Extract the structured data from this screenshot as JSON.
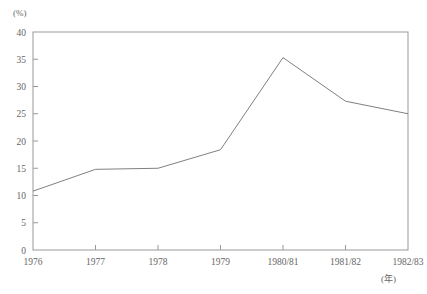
{
  "chart_data": {
    "type": "line",
    "title": "",
    "subtitle": "",
    "xlabel": "(年)",
    "ylabel": "(%)",
    "categories": [
      "1976",
      "1977",
      "1978",
      "1979",
      "1980/81",
      "1981/82",
      "1982/83"
    ],
    "values": [
      10.8,
      14.8,
      15.0,
      18.4,
      35.3,
      27.3,
      25.0
    ],
    "series": [
      {
        "name": "",
        "values": [
          10.8,
          14.8,
          15.0,
          18.4,
          35.3,
          27.3,
          25.0
        ]
      }
    ],
    "ylim": [
      0,
      40
    ],
    "yticks": [
      0,
      5,
      10,
      15,
      20,
      25,
      30,
      35,
      40
    ],
    "ytick_labels": [
      "0",
      "5",
      "10",
      "15",
      "20",
      "25",
      "30",
      "35",
      "40"
    ],
    "xtick_labels": [
      "1976",
      "1977",
      "1978",
      "1979",
      "1980/81",
      "1981/82",
      "1982/83"
    ],
    "grid": false,
    "legend": "none",
    "line_color": "#808080",
    "axis_color": "#999999",
    "background_color": "#ffffff",
    "markers": false
  },
  "axis_units": {
    "y_unit": "(%)",
    "x_unit": "(年)"
  }
}
